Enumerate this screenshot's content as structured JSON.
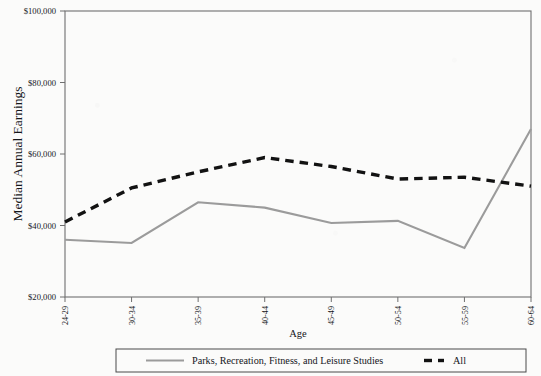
{
  "chart_data": {
    "type": "line",
    "title": "",
    "xlabel": "Age",
    "ylabel": "Median Annual Earnings",
    "categories": [
      "24-29",
      "30-34",
      "35-39",
      "40-44",
      "45-49",
      "50-54",
      "55-59",
      "60-64"
    ],
    "ylim": [
      20000,
      100000
    ],
    "ytick_values": [
      20000,
      40000,
      60000,
      80000,
      100000
    ],
    "ytick_labels": [
      "$20,000",
      "$40,000",
      "$60,000",
      "$80,000",
      "$100,000"
    ],
    "grid": false,
    "legend_position": "bottom",
    "series": [
      {
        "name": "Parks, Recreation, Fitness, and Leisure Studies",
        "color": "#9b9b9b",
        "style": "solid",
        "values": [
          36000,
          35100,
          46500,
          45000,
          40700,
          41300,
          33700,
          67000
        ]
      },
      {
        "name": "All",
        "color": "#121212",
        "style": "dashed",
        "values": [
          41000,
          50500,
          55000,
          59000,
          56500,
          53000,
          53500,
          51000
        ]
      }
    ]
  },
  "legend": {
    "items": [
      {
        "label": "Parks, Recreation, Fitness, and Leisure Studies",
        "swatch": "solid-gray-line-swatch"
      },
      {
        "label": "All",
        "swatch": "dashed-black-line-swatch"
      }
    ]
  },
  "colors": {
    "series_primary": "#9b9b9b",
    "series_secondary": "#121212",
    "axis": "#6f6f6f",
    "background": "#fbfbfa"
  }
}
